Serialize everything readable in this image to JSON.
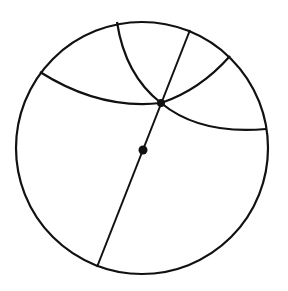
{
  "diagram": {
    "type": "circle-with-great-circle-arcs",
    "stroke_color": "#111111",
    "background": "#ffffff",
    "circle": {
      "cx": 143,
      "cy": 149,
      "r": 127
    },
    "center_point": {
      "x": 143,
      "y": 150
    },
    "intersection_point": {
      "x": 161,
      "y": 103
    },
    "line_endpoints": [
      {
        "x": 190,
        "y": 30
      },
      {
        "x": 97,
        "y": 267
      }
    ],
    "arcs": 3
  }
}
